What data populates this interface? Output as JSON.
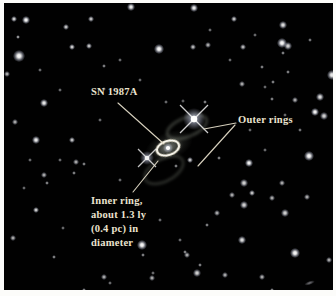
{
  "figure": {
    "frame_color": "#fcfcfa",
    "photo": {
      "x": 4,
      "y": 3,
      "width": 329,
      "height": 287,
      "background": "#010101"
    },
    "style": {
      "text_color": "#ebe3cf",
      "line_color": "#e6dfcb"
    },
    "labels": {
      "sn": {
        "text": "SN 1987A",
        "x": 91,
        "y": 85
      },
      "outer": {
        "text": "Outer rings",
        "x": 238,
        "y": 113
      },
      "inner": {
        "x": 91,
        "y": 194,
        "lines": [
          "Inner ring,",
          "about 1.3 ly",
          "(0.4 pc) in",
          "diameter"
        ]
      }
    },
    "leader_lines": [
      {
        "x1": 118,
        "y1": 103,
        "x2": 164,
        "y2": 144
      },
      {
        "x1": 236,
        "y1": 123,
        "x2": 204,
        "y2": 129
      },
      {
        "x1": 235,
        "y1": 125,
        "x2": 198,
        "y2": 166
      },
      {
        "x1": 133,
        "y1": 192,
        "x2": 158,
        "y2": 161
      }
    ],
    "sn_remnant": {
      "glows": [
        {
          "cx": 169,
          "cy": 146,
          "rx": 25,
          "ry": 14,
          "rot": -22,
          "o": 0.32
        },
        {
          "cx": 168,
          "cy": 148,
          "rx": 16,
          "ry": 10,
          "rot": -20,
          "o": 0.5
        }
      ],
      "outer_rings": [
        {
          "cx": 187,
          "cy": 127,
          "rx": 21,
          "ry": 9.5,
          "rot": -22,
          "o": 0.42
        },
        {
          "cx": 164,
          "cy": 170,
          "rx": 21,
          "ry": 11,
          "rot": -28,
          "o": 0.34
        }
      ],
      "inner_ring": {
        "cx": 168,
        "cy": 148,
        "rx": 11.5,
        "ry": 7,
        "rot": -18
      },
      "core": {
        "cx": 168,
        "cy": 148,
        "r": 2.1
      }
    },
    "spiked_stars": [
      {
        "x": 194,
        "y": 119,
        "core": 3.2,
        "glow": 11,
        "spike": 14,
        "o": 1
      },
      {
        "x": 147,
        "y": 158,
        "core": 2.3,
        "glow": 7,
        "spike": 9,
        "o": 0.95
      }
    ],
    "streaks": [
      {
        "x1": 306,
        "y1": 75,
        "x2": 336,
        "y2": 75,
        "o": 0.7
      }
    ],
    "smudges": [
      {
        "x": 309,
        "y": 283,
        "w": 11,
        "h": 3.5,
        "rot": -20,
        "o": 0.65
      }
    ],
    "stars": [
      [
        14,
        19,
        1.2,
        0.85
      ],
      [
        26,
        20,
        1.8,
        1
      ],
      [
        66,
        27,
        1.2,
        0.8
      ],
      [
        91,
        19,
        1.3,
        0.8
      ],
      [
        131,
        7,
        1.8,
        0.95
      ],
      [
        194,
        8,
        1.8,
        0.95
      ],
      [
        234,
        19,
        1.3,
        0.8
      ],
      [
        283,
        25,
        1.6,
        0.9
      ],
      [
        210,
        30,
        0.8,
        0.5
      ],
      [
        255,
        35,
        0.8,
        0.5
      ],
      [
        310,
        40,
        0.9,
        0.55
      ],
      [
        18,
        37,
        1.1,
        0.7
      ],
      [
        40,
        70,
        0.8,
        0.5
      ],
      [
        72,
        47,
        1.5,
        0.85
      ],
      [
        89,
        46,
        1.4,
        0.8
      ],
      [
        159,
        49,
        2.2,
        1
      ],
      [
        193,
        47,
        1.3,
        0.75
      ],
      [
        208,
        45,
        1.2,
        0.7
      ],
      [
        243,
        47,
        1.3,
        0.75
      ],
      [
        282,
        43,
        2.2,
        1
      ],
      [
        288,
        46,
        1.6,
        0.85
      ],
      [
        283,
        53,
        1.1,
        0.6
      ],
      [
        19,
        56,
        2.6,
        1
      ],
      [
        60,
        90,
        0.8,
        0.5
      ],
      [
        104,
        66,
        1.0,
        0.6
      ],
      [
        120,
        60,
        0.8,
        0.5
      ],
      [
        140,
        80,
        0.9,
        0.5
      ],
      [
        7,
        74,
        1.2,
        0.7
      ],
      [
        262,
        67,
        1.1,
        0.6
      ],
      [
        273,
        82,
        1.1,
        0.6
      ],
      [
        288,
        72,
        1.1,
        0.6
      ],
      [
        230,
        60,
        0.9,
        0.5
      ],
      [
        332,
        75,
        2.3,
        0.95
      ],
      [
        44,
        103,
        1.8,
        0.95
      ],
      [
        104,
        89,
        0.9,
        0.5
      ],
      [
        100,
        120,
        0.8,
        0.5
      ],
      [
        15,
        122,
        1.2,
        0.7
      ],
      [
        36,
        140,
        1.8,
        0.95
      ],
      [
        72,
        140,
        1.3,
        0.8
      ],
      [
        242,
        84,
        1.2,
        0.7
      ],
      [
        295,
        100,
        1.2,
        0.7
      ],
      [
        265,
        87,
        0.9,
        0.5
      ],
      [
        272,
        99,
        1.1,
        0.6
      ],
      [
        320,
        97,
        1.7,
        0.9
      ],
      [
        315,
        112,
        2.0,
        1
      ],
      [
        324,
        116,
        1.6,
        0.85
      ],
      [
        285,
        115,
        0.9,
        0.5
      ],
      [
        205,
        102,
        1.1,
        0.6
      ],
      [
        250,
        130,
        0.9,
        0.5
      ],
      [
        300,
        130,
        0.9,
        0.55
      ],
      [
        265,
        150,
        0.8,
        0.5
      ],
      [
        166,
        102,
        0.8,
        0.5
      ],
      [
        183,
        101,
        0.7,
        0.45
      ],
      [
        76,
        162,
        1.2,
        0.7
      ],
      [
        84,
        164,
        1.1,
        0.6
      ],
      [
        44,
        175,
        1.2,
        0.7
      ],
      [
        74,
        173,
        1.1,
        0.6
      ],
      [
        47,
        183,
        1.1,
        0.6
      ],
      [
        30,
        160,
        0.8,
        0.5
      ],
      [
        60,
        160,
        0.8,
        0.5
      ],
      [
        24,
        188,
        0.9,
        0.5
      ],
      [
        36,
        210,
        1.5,
        0.85
      ],
      [
        63,
        228,
        0.9,
        0.5
      ],
      [
        13,
        238,
        1.2,
        0.7
      ],
      [
        54,
        257,
        1.0,
        0.6
      ],
      [
        120,
        180,
        0.8,
        0.5
      ],
      [
        160,
        220,
        0.8,
        0.5
      ],
      [
        180,
        240,
        0.8,
        0.5
      ],
      [
        219,
        158,
        1.0,
        0.6
      ],
      [
        249,
        163,
        2.0,
        1
      ],
      [
        309,
        156,
        2.4,
        1
      ],
      [
        244,
        183,
        1.6,
        0.85
      ],
      [
        252,
        193,
        1.4,
        0.8
      ],
      [
        232,
        195,
        1.2,
        0.7
      ],
      [
        272,
        198,
        1.2,
        0.7
      ],
      [
        282,
        183,
        1.2,
        0.7
      ],
      [
        307,
        197,
        1.2,
        0.7
      ],
      [
        244,
        205,
        1.6,
        0.85
      ],
      [
        285,
        213,
        1.6,
        0.85
      ],
      [
        217,
        213,
        1.2,
        0.7
      ],
      [
        207,
        225,
        1.0,
        0.6
      ],
      [
        242,
        240,
        1.7,
        0.9
      ],
      [
        295,
        253,
        2.3,
        1
      ],
      [
        329,
        260,
        1.2,
        0.7
      ],
      [
        187,
        255,
        1.2,
        0.7
      ],
      [
        185,
        252,
        1.0,
        0.6
      ],
      [
        200,
        265,
        1.0,
        0.6
      ],
      [
        153,
        273,
        0.8,
        0.5
      ],
      [
        110,
        283,
        0.8,
        0.5
      ],
      [
        142,
        245,
        2.4,
        1
      ],
      [
        143,
        255,
        1.0,
        0.6
      ],
      [
        104,
        277,
        1.2,
        0.7
      ],
      [
        152,
        278,
        1.2,
        0.7
      ],
      [
        84,
        290,
        1.1,
        0.6
      ],
      [
        197,
        273,
        1.6,
        0.85
      ],
      [
        225,
        275,
        1.2,
        0.7
      ],
      [
        262,
        277,
        1.2,
        0.7
      ],
      [
        272,
        290,
        1.1,
        0.6
      ],
      [
        190,
        160,
        1.4,
        0.8
      ],
      [
        176,
        166,
        1.0,
        0.6
      ]
    ]
  }
}
